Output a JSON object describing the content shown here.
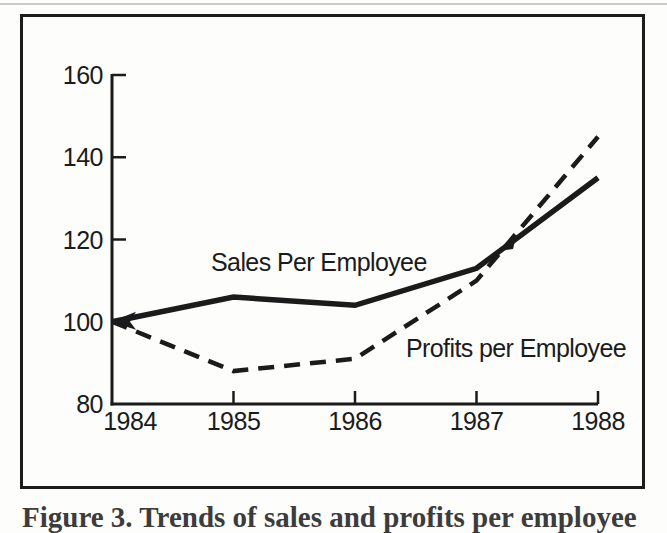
{
  "page": {
    "background": "#fdfdfb",
    "ink": "#1b1b1b"
  },
  "chart_data": {
    "type": "line",
    "title": "",
    "xlabel": "",
    "ylabel": "",
    "x": [
      1984,
      1985,
      1986,
      1987,
      1988
    ],
    "series": [
      {
        "name": "Sales Per Employee",
        "line_style": "solid",
        "values": [
          100,
          106,
          104,
          113,
          135
        ]
      },
      {
        "name": "Profits per Employee",
        "line_style": "dashed",
        "values": [
          100,
          88,
          91,
          110,
          145
        ]
      }
    ],
    "ylim": [
      80,
      160
    ],
    "yticks": [
      80,
      100,
      120,
      140,
      160
    ],
    "grid": false,
    "legend_position": "inline-labels-on-plot",
    "annotations": [
      {
        "name": "start-arrowhead",
        "x": 1984,
        "y": 100,
        "shape": "left-arrowhead"
      },
      {
        "name": "lines-crossing-mark",
        "between_x": [
          1987,
          1988
        ],
        "shape": "small-wedge"
      }
    ]
  },
  "caption": {
    "visible_fragment": "Figure 3. Trends of sales and profits per employee"
  }
}
